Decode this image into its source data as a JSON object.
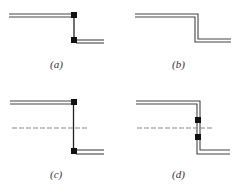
{
  "figure": {
    "panels": [
      {
        "id": "a",
        "label": "(a)",
        "description": "Double-line step with square junction markers at both corners, single vertical connector"
      },
      {
        "id": "b",
        "label": "(b)",
        "description": "Continuous double-line step with no markers"
      },
      {
        "id": "c",
        "label": "(c)",
        "description": "Same as (a) with horizontal dashed line crossing the vertical connector"
      },
      {
        "id": "d",
        "label": "(d)",
        "description": "Double-line step with two square markers on the vertical segment straddling a horizontal dashed line"
      }
    ],
    "colors": {
      "line": "#444444",
      "marker": "#111111",
      "dash": "#888888"
    }
  }
}
